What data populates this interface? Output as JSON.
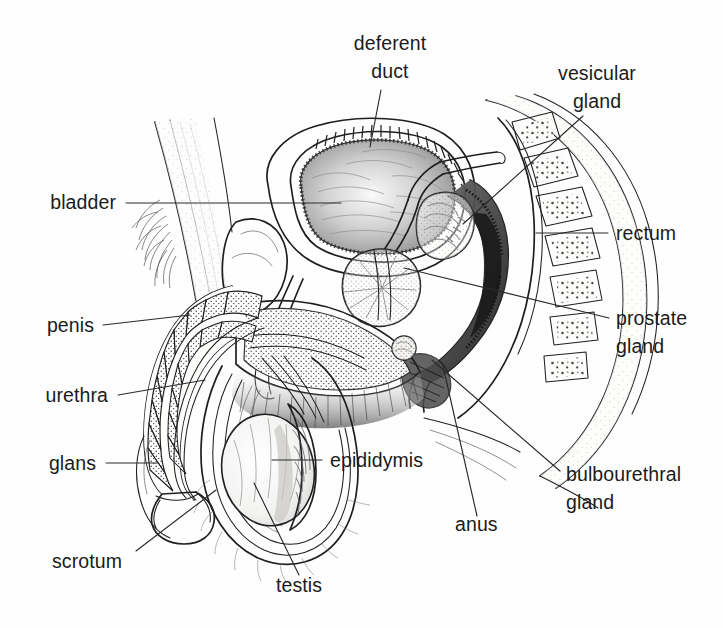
{
  "figure": {
    "type": "anatomical-line-diagram",
    "style": "black and white pen-and-ink medical illustration",
    "background_color": "#ffffff",
    "ink_color": "#1f1f1f",
    "label_color": "#1b1b1b",
    "label_font_size_px": 19.5
  },
  "labels": [
    {
      "id": "deferent-duct",
      "lines": [
        "deferent",
        "duct"
      ],
      "line1": "deferent",
      "line2": "duct",
      "anchor": "middle",
      "x": 390,
      "y1": 50,
      "y2": 78,
      "leader": "M 381 90 L 370 147"
    },
    {
      "id": "vesicular-gland",
      "lines": [
        "vesicular",
        "gland"
      ],
      "line1": "vesicular",
      "line2": "gland",
      "anchor": "middle",
      "x": 597,
      "y1": 80,
      "y2": 108,
      "leader": "M 583 116 L 463 224"
    },
    {
      "id": "bladder",
      "lines": [
        "bladder"
      ],
      "line1": "bladder",
      "anchor": "end",
      "x": 116,
      "y1": 209,
      "leader": "M 126 203 L 341 203"
    },
    {
      "id": "rectum",
      "lines": [
        "rectum"
      ],
      "line1": "rectum",
      "anchor": "start",
      "x": 616,
      "y1": 240,
      "leader": "M 608 233 L 536 233"
    },
    {
      "id": "prostate-gland",
      "lines": [
        "prostate",
        "gland"
      ],
      "line1": "prostate",
      "line2": "gland",
      "anchor": "start",
      "x": 616,
      "y1": 325,
      "y2": 353,
      "leader": "M 609 318 L 404 268"
    },
    {
      "id": "penis",
      "lines": [
        "penis"
      ],
      "line1": "penis",
      "anchor": "end",
      "x": 94,
      "y1": 332,
      "leader": "M 103 325 L 190 315"
    },
    {
      "id": "urethra",
      "lines": [
        "urethra"
      ],
      "line1": "urethra",
      "anchor": "end",
      "x": 108,
      "y1": 402,
      "leader": "M 118 395 L 205 380"
    },
    {
      "id": "glans",
      "lines": [
        "glans"
      ],
      "line1": "glans",
      "anchor": "end",
      "x": 96,
      "y1": 470,
      "leader": "M 106 463 L 158 463"
    },
    {
      "id": "epididymis",
      "lines": [
        "epididymis"
      ],
      "line1": "epididymis",
      "anchor": "start",
      "x": 330,
      "y1": 467,
      "leader": "M 322 460 L 272 460"
    },
    {
      "id": "bulbourethral-gland",
      "lines": [
        "bulbourethral",
        "gland"
      ],
      "line1": "bulbourethral",
      "line2": "gland",
      "anchor": "start",
      "x": 566,
      "y1": 481,
      "y2": 509,
      "leader": "M 560 471 L 432 360"
    },
    {
      "id": "anus",
      "lines": [
        "anus"
      ],
      "line1": "anus",
      "anchor": "start",
      "x": 455,
      "y1": 531,
      "leader": "M 477 516 L 443 366"
    },
    {
      "id": "scrotum",
      "lines": [
        "scrotum"
      ],
      "line1": "scrotum",
      "anchor": "start",
      "x": 52,
      "y1": 568,
      "leader": "M 136 551 L 216 490"
    },
    {
      "id": "testis",
      "lines": [
        "testis"
      ],
      "line1": "testis",
      "anchor": "start",
      "x": 276,
      "y1": 592,
      "leader": "M 299 575 L 254 483"
    }
  ],
  "structures": [
    "bladder",
    "deferent duct",
    "vesicular gland",
    "prostate gland",
    "bulbourethral gland",
    "rectum",
    "anus",
    "penis",
    "urethra",
    "glans",
    "scrotum",
    "testis",
    "epididymis",
    "pubic bone",
    "sacrum and vertebrae"
  ]
}
